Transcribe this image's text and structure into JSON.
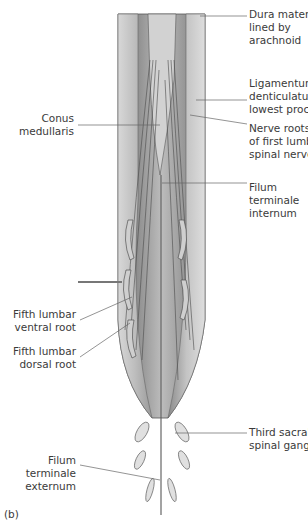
{
  "figure": {
    "panel_label": "(b)",
    "labels_right": [
      {
        "id": "dura",
        "text": "Dura mater,\nlined by\narachnoid"
      },
      {
        "id": "ligamentum",
        "text": "Ligamentum\ndenticulatum,\nlowest process"
      },
      {
        "id": "nerve-roots",
        "text": "Nerve roots\nof first lumbar\nspinal nerve"
      },
      {
        "id": "filum-internum",
        "text": "Filum\nterminale\ninternum"
      },
      {
        "id": "third-sacral",
        "text": "Third sacral\nspinal ganglion"
      }
    ],
    "labels_left": [
      {
        "id": "conus",
        "text": "Conus\nmedullaris"
      },
      {
        "id": "fifth-ventral",
        "text": "Fifth lumbar\nventral root"
      },
      {
        "id": "fifth-dorsal",
        "text": "Fifth lumbar\ndorsal root"
      },
      {
        "id": "filum-externum",
        "text": "Filum\nterminale\nexternum"
      }
    ]
  }
}
